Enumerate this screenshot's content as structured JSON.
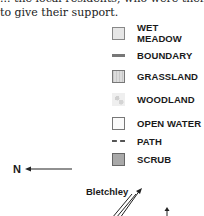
{
  "prose": {
    "line1": "... the local residents, who were then asked",
    "line2": "to give their support."
  },
  "legend": {
    "items": [
      {
        "key": "wet-meadow",
        "label": "WET MEADOW",
        "symbol": "swatch-light-textured"
      },
      {
        "key": "boundary",
        "label": "BOUNDARY",
        "symbol": "solid-line"
      },
      {
        "key": "grassland",
        "label": "GRASSLAND",
        "symbol": "swatch-hatched"
      },
      {
        "key": "woodland",
        "label": "WOODLAND",
        "symbol": "swatch-tree-texture"
      },
      {
        "key": "open-water",
        "label": "OPEN WATER",
        "symbol": "swatch-white"
      },
      {
        "key": "path",
        "label": "PATH",
        "symbol": "dashed-line"
      },
      {
        "key": "scrub",
        "label": "SCRUB",
        "symbol": "swatch-grey"
      }
    ]
  },
  "map": {
    "north_label": "N",
    "places": [
      {
        "name": "Bletchley"
      }
    ]
  },
  "colors": {
    "scrub": "#a9a9a9",
    "boundary": "#777777",
    "text": "#1a1a1a"
  }
}
